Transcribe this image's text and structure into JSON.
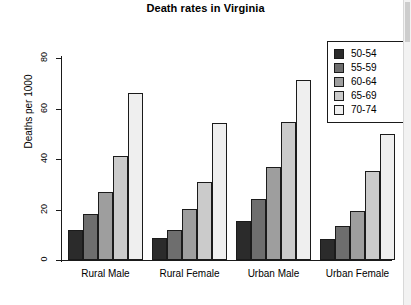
{
  "chart_data": {
    "type": "bar",
    "title": "Death rates in Virginia",
    "xlabel": "",
    "ylabel": "Deaths per 1000",
    "categories": [
      "Rural Male",
      "Rural Female",
      "Urban Male",
      "Urban Female"
    ],
    "series": [
      {
        "name": "50-54",
        "values": [
          11.7,
          8.7,
          15.4,
          8.4
        ],
        "color": "#2b2b2b"
      },
      {
        "name": "55-59",
        "values": [
          18.1,
          11.7,
          24.3,
          13.6
        ],
        "color": "#6e6e6e"
      },
      {
        "name": "60-64",
        "values": [
          26.9,
          20.3,
          37.0,
          19.3
        ],
        "color": "#9e9e9e"
      },
      {
        "name": "65-69",
        "values": [
          41.0,
          30.9,
          54.6,
          35.1
        ],
        "color": "#cbcbcb"
      },
      {
        "name": "70-74",
        "values": [
          66.0,
          54.3,
          71.1,
          50.0
        ],
        "color": "#efefef"
      }
    ],
    "ylim": [
      0,
      80
    ],
    "yticks": [
      0,
      20,
      40,
      60,
      80
    ],
    "grid": false,
    "legend_position": "top-right",
    "legend_entries": [
      "50-54",
      "55-59",
      "60-64",
      "65-69",
      "70-74"
    ]
  }
}
